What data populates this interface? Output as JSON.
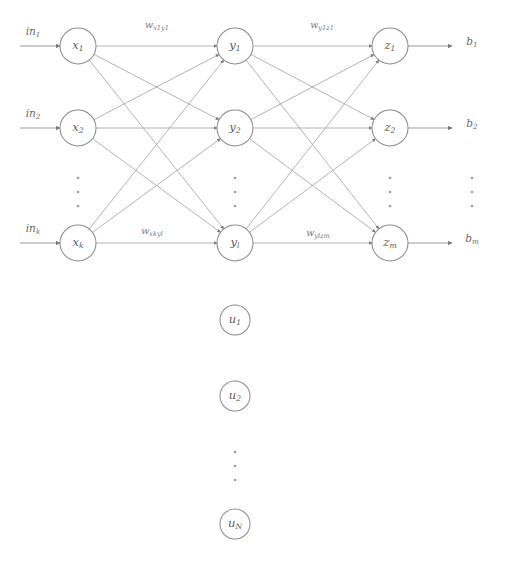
{
  "figure": {
    "type": "diagram",
    "canvas": {
      "width": 505,
      "height": 565
    },
    "background_color": "#ffffff",
    "stroke_color": "#9b9b9b",
    "text_color": "#5d5d5d"
  },
  "layers": {
    "input": {
      "name": "input-layer",
      "x": 78,
      "nodes": [
        {
          "id": "x1",
          "base": "x",
          "sub": "1",
          "cy": 46
        },
        {
          "id": "x2",
          "base": "x",
          "sub": "2",
          "cy": 128
        },
        {
          "id": "xk",
          "base": "x",
          "sub": "k",
          "cy": 243
        }
      ],
      "ellipsis": {
        "x": 78,
        "dots_y": [
          178,
          192,
          206
        ]
      }
    },
    "hidden": {
      "name": "hidden-layer",
      "x": 235,
      "nodes": [
        {
          "id": "y1",
          "base": "y",
          "sub": "1",
          "cy": 46
        },
        {
          "id": "y2",
          "base": "y",
          "sub": "2",
          "cy": 128
        },
        {
          "id": "yl",
          "base": "y",
          "sub": "l",
          "cy": 243
        }
      ],
      "ellipsis": {
        "x": 235,
        "dots_y": [
          178,
          192,
          206
        ]
      }
    },
    "output": {
      "name": "output-layer",
      "x": 390,
      "nodes": [
        {
          "id": "z1",
          "base": "z",
          "sub": "1",
          "cy": 46
        },
        {
          "id": "z2",
          "base": "z",
          "sub": "2",
          "cy": 128
        },
        {
          "id": "zm",
          "base": "z",
          "sub": "m",
          "cy": 243
        }
      ],
      "ellipsis": {
        "x": 390,
        "dots_y": [
          178,
          192,
          206
        ]
      }
    },
    "context": {
      "name": "context-layer",
      "x": 235,
      "nodes": [
        {
          "id": "u1",
          "base": "u",
          "sub": "1",
          "cy": 320
        },
        {
          "id": "u2",
          "base": "u",
          "sub": "2",
          "cy": 396
        },
        {
          "id": "uN",
          "base": "u",
          "sub": "N",
          "cy": 524
        }
      ],
      "ellipsis": {
        "x": 235,
        "dots_y": [
          452,
          466,
          480
        ]
      }
    }
  },
  "inputs": [
    {
      "id": "in1",
      "base": "in",
      "sub": "1",
      "x": 33,
      "y": 32,
      "line_y": 46
    },
    {
      "id": "in2",
      "base": "in",
      "sub": "2",
      "x": 33,
      "y": 114,
      "line_y": 128
    },
    {
      "id": "ink",
      "base": "in",
      "sub": "k",
      "x": 33,
      "y": 229,
      "line_y": 243
    }
  ],
  "outputs": [
    {
      "id": "b1",
      "base": "b",
      "sub": "1",
      "x": 472,
      "y": 42,
      "line_y": 46
    },
    {
      "id": "b2",
      "base": "b",
      "sub": "2",
      "x": 472,
      "y": 124,
      "line_y": 128
    },
    {
      "id": "bm",
      "base": "b",
      "sub": "m",
      "x": 472,
      "y": 239,
      "line_y": 243
    }
  ],
  "output_ellipsis": {
    "x": 472,
    "dots_y": [
      178,
      192,
      206
    ]
  },
  "weight_labels": [
    {
      "id": "w-x1y1",
      "base": "w",
      "sub": "x1y1",
      "x": 157,
      "y": 25
    },
    {
      "id": "w-y1z1",
      "base": "w",
      "sub": "y1z1",
      "x": 322,
      "y": 25
    },
    {
      "id": "w-xkyl",
      "base": "w",
      "sub": "xkyl",
      "x": 152,
      "y": 231
    },
    {
      "id": "w-ylzm",
      "base": "w",
      "sub": "ylzm",
      "x": 318,
      "y": 233
    }
  ],
  "node_radius": 18,
  "context_node_radius": 15,
  "caption": {
    "title": "Recurrent neural network",
    "input_label": "in",
    "output_label": "b",
    "weight_symbol": "w"
  }
}
